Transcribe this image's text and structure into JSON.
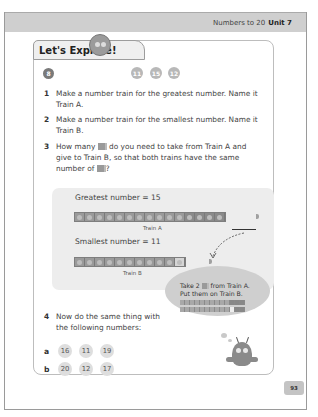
{
  "header": {
    "section": "Numbers to 20",
    "unit": "Unit 7"
  },
  "activity": {
    "title": "Let's Explore!",
    "question_number": "8",
    "numbers": [
      "11",
      "15",
      "12"
    ]
  },
  "steps": [
    {
      "num": "1",
      "text": "Make a number train for the greatest number. Name it Train A."
    },
    {
      "num": "2",
      "text": "Make a number train for the smallest number. Name it Train B."
    },
    {
      "num": "3",
      "text_before": "How many",
      "text_middle": "do you need to take from Train A and give to Train B, so that both trains have the same number of",
      "text_after": "?"
    }
  ],
  "figure": {
    "greatest_label": "Greatest number = 15",
    "smallest_label": "Smallest number = 11",
    "train_a_caption": "Train A",
    "train_b_caption": "Train B",
    "train_a_cubes": 15,
    "train_b_cubes": 11
  },
  "bubble": {
    "line1_before": "Take 2",
    "line1_after": "from Train A.",
    "line2": "Put them on Train B."
  },
  "step4": {
    "num": "4",
    "text": "Now do the same thing with the following numbers:",
    "rows": [
      {
        "letter": "a",
        "values": [
          "16",
          "11",
          "19"
        ]
      },
      {
        "letter": "b",
        "values": [
          "20",
          "12",
          "17"
        ]
      }
    ]
  },
  "page_number": "93",
  "colors": {
    "header_band": "#cfcfcf",
    "figure_bg": "#ededed",
    "bubble_bg": "#cfcfcf",
    "chip_bg": "#dedede"
  }
}
